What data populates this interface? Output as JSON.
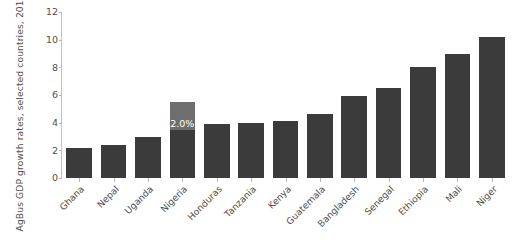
{
  "chart_data": {
    "type": "bar",
    "title": "",
    "subtitle": "",
    "xlabel": "",
    "ylabel": "AgBus GDP growth rates, selected countries, 2013–18 (%)",
    "ylim": [
      0,
      12
    ],
    "ytick_labels": [
      "0",
      "2",
      "4",
      "6",
      "8",
      "10",
      "12"
    ],
    "ytick_values": [
      0,
      2,
      4,
      6,
      8,
      10,
      12
    ],
    "grid": false,
    "legend": null,
    "categories": [
      "Ghana",
      "Nepal",
      "Uganda",
      "Nigeria",
      "Honduras",
      "Tanzania",
      "Kenya",
      "Guatemala",
      "Bangladesh",
      "Senegal",
      "Ethiopia",
      "Mali",
      "Niger"
    ],
    "values": [
      2.2,
      2.4,
      3.0,
      5.5,
      3.9,
      4.0,
      4.1,
      4.6,
      5.9,
      6.5,
      8.0,
      9.0,
      10.2
    ],
    "bar_color": "#3b3b3b",
    "highlight_color": "#6e6e6e",
    "annotations": [
      {
        "category": "Nigeria",
        "label": "2.0%",
        "segment_from": 3.5,
        "segment_to": 5.5,
        "text_color": "#ffffff"
      }
    ]
  }
}
